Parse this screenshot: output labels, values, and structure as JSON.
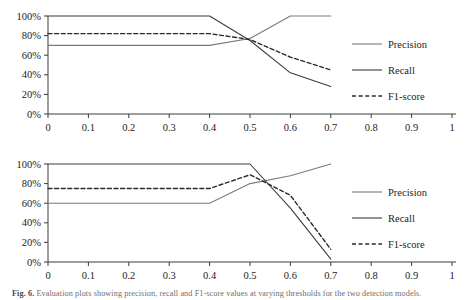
{
  "figure": {
    "caption_prefix": "Fig. 6.",
    "caption_text": "Evaluation plots showing precision, recall and F1-score values at varying thresholds for the two detection models."
  },
  "legend": {
    "items": [
      {
        "label": "Precision",
        "style": "solid",
        "color": "#7a7a7a"
      },
      {
        "label": "Recall",
        "style": "solid",
        "color": "#3d3d3d"
      },
      {
        "label": "F1-score",
        "style": "dashed",
        "color": "#2b2b2b"
      }
    ]
  },
  "axes": {
    "y_ticks": [
      "0%",
      "20%",
      "40%",
      "60%",
      "80%",
      "100%"
    ],
    "x_ticks": [
      "0",
      "0.1",
      "0.2",
      "0.3",
      "0.4",
      "0.5",
      "0.6",
      "0.7",
      "0.8",
      "0.9",
      "1"
    ],
    "ylim": [
      0,
      100
    ],
    "xlim": [
      0,
      1
    ]
  },
  "chart_data": [
    {
      "type": "line",
      "title": "",
      "xlabel": "",
      "ylabel": "",
      "xlim": [
        0,
        1
      ],
      "ylim": [
        0,
        100
      ],
      "grid": false,
      "legend_position": "right",
      "x_tick_labels": [
        "0",
        "0.1",
        "0.2",
        "0.3",
        "0.4",
        "0.5",
        "0.6",
        "0.7",
        "0.8",
        "0.9",
        "1"
      ],
      "y_tick_labels": [
        "0%",
        "20%",
        "40%",
        "60%",
        "80%",
        "100%"
      ],
      "series": [
        {
          "name": "Precision",
          "style": "solid",
          "color": "#7a7a7a",
          "x": [
            0,
            0.1,
            0.2,
            0.3,
            0.4,
            0.5,
            0.6,
            0.7
          ],
          "values": [
            70,
            70,
            70,
            70,
            70,
            77,
            100,
            100
          ]
        },
        {
          "name": "Recall",
          "style": "solid",
          "color": "#3d3d3d",
          "x": [
            0,
            0.1,
            0.2,
            0.3,
            0.4,
            0.5,
            0.6,
            0.7
          ],
          "values": [
            100,
            100,
            100,
            100,
            100,
            75,
            42,
            28
          ]
        },
        {
          "name": "F1-score",
          "style": "dashed",
          "color": "#2b2b2b",
          "x": [
            0,
            0.1,
            0.2,
            0.3,
            0.4,
            0.5,
            0.6,
            0.7
          ],
          "values": [
            82,
            82,
            82,
            82,
            82,
            76,
            58,
            45
          ]
        }
      ]
    },
    {
      "type": "line",
      "title": "",
      "xlabel": "",
      "ylabel": "",
      "xlim": [
        0,
        1
      ],
      "ylim": [
        0,
        100
      ],
      "grid": false,
      "legend_position": "right",
      "x_tick_labels": [
        "0",
        "0.1",
        "0.2",
        "0.3",
        "0.4",
        "0.5",
        "0.6",
        "0.7",
        "0.8",
        "0.9",
        "1"
      ],
      "y_tick_labels": [
        "0%",
        "20%",
        "40%",
        "60%",
        "80%",
        "100%"
      ],
      "series": [
        {
          "name": "Precision",
          "style": "solid",
          "color": "#7a7a7a",
          "x": [
            0,
            0.1,
            0.2,
            0.3,
            0.4,
            0.5,
            0.6,
            0.7
          ],
          "values": [
            60,
            60,
            60,
            60,
            60,
            80,
            88,
            100
          ]
        },
        {
          "name": "Recall",
          "style": "solid",
          "color": "#3d3d3d",
          "x": [
            0,
            0.1,
            0.2,
            0.3,
            0.4,
            0.5,
            0.6,
            0.7
          ],
          "values": [
            100,
            100,
            100,
            100,
            100,
            100,
            55,
            3
          ]
        },
        {
          "name": "F1-score",
          "style": "dashed",
          "color": "#2b2b2b",
          "x": [
            0,
            0.1,
            0.2,
            0.3,
            0.4,
            0.5,
            0.6,
            0.7
          ],
          "values": [
            75,
            75,
            75,
            75,
            75,
            89,
            68,
            13
          ]
        }
      ]
    }
  ]
}
